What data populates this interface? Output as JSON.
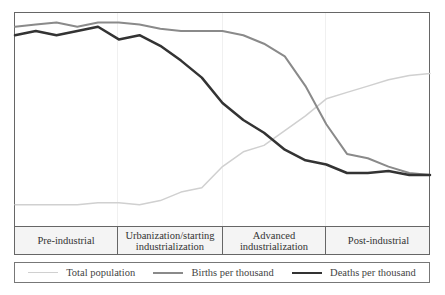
{
  "chart_data": {
    "type": "line",
    "title": "",
    "xlabel": "",
    "ylabel": "",
    "grid": false,
    "legend_position": "bottom",
    "x": [
      0,
      5,
      10,
      15,
      20,
      25,
      30,
      35,
      40,
      45,
      50,
      55,
      60,
      65,
      70,
      75,
      80,
      85,
      90,
      95,
      100
    ],
    "series": [
      {
        "name": "Total population",
        "color": "#d0d0d0",
        "values": [
          10,
          10,
          10,
          10,
          11,
          11,
          10,
          12,
          16,
          18,
          28,
          35,
          38,
          45,
          52,
          60,
          63,
          66,
          69,
          71,
          72
        ]
      },
      {
        "name": "Births per thousand",
        "color": "#8a8a8a",
        "values": [
          94,
          95,
          96,
          94,
          96,
          96,
          95,
          93,
          92,
          92,
          92,
          90,
          86,
          80,
          66,
          48,
          34,
          32,
          28,
          25,
          24
        ]
      },
      {
        "name": "Deaths per thousand",
        "color": "#333333",
        "values": [
          90,
          92,
          90,
          92,
          94,
          88,
          90,
          85,
          78,
          70,
          58,
          50,
          44,
          36,
          31,
          29,
          25,
          25,
          26,
          24,
          24
        ]
      }
    ],
    "stages": [
      "Pre-industrial",
      "Urbanization/starting industrialization",
      "Advanced industrialization",
      "Post-industrial"
    ],
    "ylim": [
      0,
      100
    ]
  },
  "stages": [
    {
      "label": "Pre-industrial",
      "width": 103
    },
    {
      "label": "Urbanization/starting\nindustrialization",
      "width": 105
    },
    {
      "label": "Advanced\nindustrialization",
      "width": 103
    },
    {
      "label": "Post-industrial",
      "width": 105
    }
  ],
  "legend": [
    {
      "label": "Total population",
      "color": "#d0d0d0",
      "thickness": 1.5
    },
    {
      "label": "Births per thousand",
      "color": "#8a8a8a",
      "thickness": 2
    },
    {
      "label": "Deaths per thousand",
      "color": "#333333",
      "thickness": 2.5
    }
  ]
}
